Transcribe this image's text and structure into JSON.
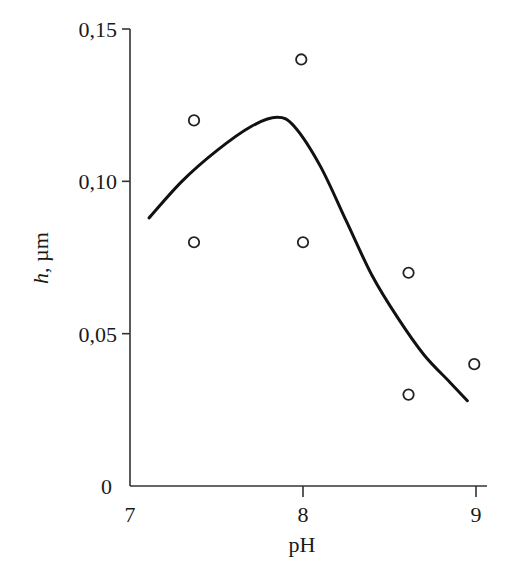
{
  "chart_data": {
    "type": "scatter",
    "title": "",
    "xlabel": "pH",
    "ylabel_var": "h",
    "ylabel_unit": ", µm",
    "ylabel": "h, µm",
    "xlim": [
      7,
      9
    ],
    "ylim": [
      0,
      0.15
    ],
    "grid": false,
    "legend": null,
    "x_ticks": [
      7,
      8,
      9
    ],
    "x_tick_labels": [
      "7",
      "8",
      "9"
    ],
    "y_ticks": [
      0,
      0.05,
      0.1,
      0.15
    ],
    "y_tick_labels": [
      "0",
      "0,05",
      "0,10",
      "0,15"
    ],
    "series": [
      {
        "name": "measured",
        "type": "scatter",
        "marker": "open-circle",
        "points": [
          {
            "x": 7.37,
            "y": 0.12
          },
          {
            "x": 7.37,
            "y": 0.08
          },
          {
            "x": 7.99,
            "y": 0.14
          },
          {
            "x": 8.0,
            "y": 0.08
          },
          {
            "x": 8.61,
            "y": 0.07
          },
          {
            "x": 8.61,
            "y": 0.03
          },
          {
            "x": 8.99,
            "y": 0.04
          }
        ]
      },
      {
        "name": "fit",
        "type": "line",
        "smooth": true,
        "points": [
          {
            "x": 7.11,
            "y": 0.088
          },
          {
            "x": 7.3,
            "y": 0.1
          },
          {
            "x": 7.5,
            "y": 0.11
          },
          {
            "x": 7.7,
            "y": 0.118
          },
          {
            "x": 7.85,
            "y": 0.121
          },
          {
            "x": 7.95,
            "y": 0.118
          },
          {
            "x": 8.1,
            "y": 0.105
          },
          {
            "x": 8.25,
            "y": 0.087
          },
          {
            "x": 8.4,
            "y": 0.069
          },
          {
            "x": 8.55,
            "y": 0.055
          },
          {
            "x": 8.7,
            "y": 0.043
          },
          {
            "x": 8.85,
            "y": 0.034
          },
          {
            "x": 8.95,
            "y": 0.028
          }
        ]
      }
    ]
  }
}
